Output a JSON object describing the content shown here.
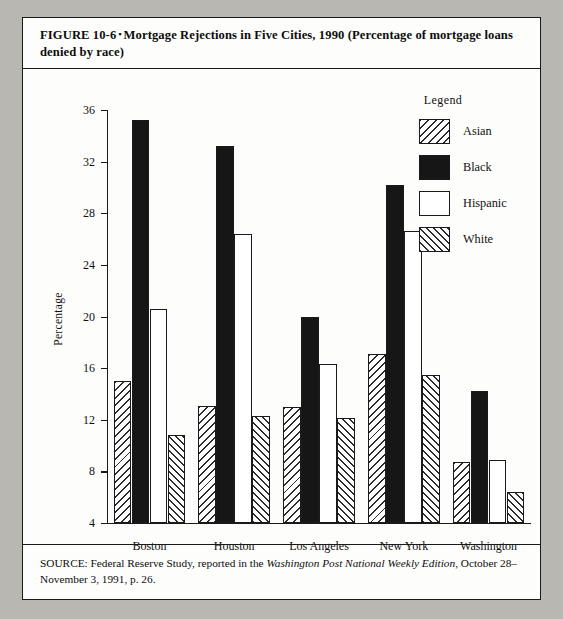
{
  "figure": {
    "caption_label": "FIGURE 10-6",
    "caption_sep": "▪",
    "caption_text": "Mortgage Rejections in Five Cities, 1990 (Percentage of mortgage loans denied by race)",
    "source_prefix": "SOURCE: Federal Reserve Study, reported in the ",
    "source_italic": "Washington Post National Weekly Edition",
    "source_suffix": ", October 28–November 3, 1991, p. 26."
  },
  "legend": {
    "title": "Legend",
    "items": [
      {
        "label": "Asian",
        "swatch": "diagonal-hatch-backslash",
        "color": "#ffffff"
      },
      {
        "label": "Black",
        "swatch": "solid-fill",
        "color": "#161616"
      },
      {
        "label": "Hispanic",
        "swatch": "empty-white",
        "color": "#ffffff"
      },
      {
        "label": "White",
        "swatch": "diagonal-hatch-slash",
        "color": "#ffffff"
      }
    ]
  },
  "chart_data": {
    "type": "bar",
    "title": "Mortgage Rejections in Five Cities, 1990 (Percentage of mortgage loans denied by race)",
    "xlabel": "",
    "ylabel": "Percentage",
    "ylim": [
      4,
      36
    ],
    "yticks": [
      4,
      8,
      12,
      16,
      20,
      24,
      28,
      32,
      36
    ],
    "grid": false,
    "legend_position": "upper-right-inside",
    "categories": [
      "Boston",
      "Houston",
      "Los Angeles",
      "New York",
      "Washington"
    ],
    "series": [
      {
        "name": "Asian",
        "values": [
          15.0,
          13.1,
          13.0,
          17.1,
          8.7
        ]
      },
      {
        "name": "Black",
        "values": [
          35.2,
          33.2,
          20.0,
          30.2,
          14.2
        ]
      },
      {
        "name": "Hispanic",
        "values": [
          20.6,
          26.4,
          16.3,
          26.6,
          8.9
        ]
      },
      {
        "name": "White",
        "values": [
          10.8,
          12.3,
          12.1,
          15.5,
          6.4
        ]
      }
    ]
  }
}
